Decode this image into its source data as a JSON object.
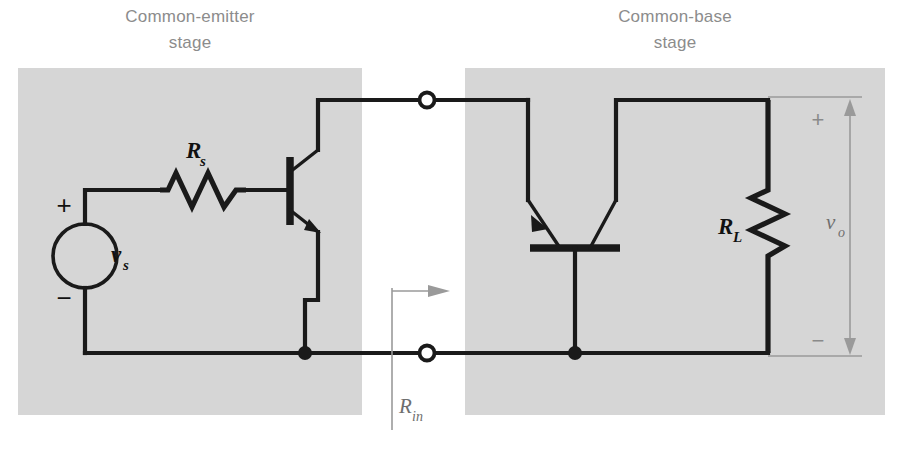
{
  "figure": {
    "type": "circuit-schematic",
    "width": 902,
    "height": 449,
    "background_color": "#ffffff",
    "panel_color": "#d6d6d6",
    "wire_color": "#1a1a1a",
    "annotation_color": "#9a9a9a"
  },
  "stages": [
    {
      "id": "common-emitter",
      "label_line1": "Common-emitter",
      "label_line2": "stage"
    },
    {
      "id": "common-base",
      "label_line1": "Common-base",
      "label_line2": "stage"
    }
  ],
  "components": {
    "source": {
      "name": "voltage-source",
      "label": "v",
      "subscript": "s",
      "plus_sign": "+",
      "minus_sign": "−"
    },
    "source_resistor": {
      "name": "series-source-resistor",
      "label": "R",
      "subscript": "s",
      "orientation": "horizontal"
    },
    "load_resistor": {
      "name": "load-resistor",
      "label": "R",
      "subscript": "L",
      "orientation": "vertical"
    },
    "transistor_q1": {
      "name": "npn-transistor-common-emitter",
      "type": "NPN",
      "orientation": "vertical"
    },
    "transistor_q2": {
      "name": "npn-transistor-common-base",
      "type": "NPN",
      "orientation": "rotated-base-down"
    }
  },
  "terminals": [
    {
      "name": "interstage-terminal-top",
      "style": "open-circle"
    },
    {
      "name": "interstage-terminal-bottom",
      "style": "open-circle"
    }
  ],
  "nodes": [
    {
      "name": "common-emitter-ground-node",
      "style": "filled-dot"
    },
    {
      "name": "common-base-ground-node",
      "style": "filled-dot"
    }
  ],
  "annotations": {
    "input_resistance": {
      "name": "r-in-annotation",
      "label": "R",
      "subscript": "in",
      "arrow": "right",
      "style": "dashed-gray"
    },
    "output_voltage": {
      "name": "v-out-annotation",
      "label": "v",
      "subscript": "o",
      "plus_sign": "+",
      "minus_sign": "−",
      "arrow": "double-ended-vertical",
      "style": "dashed-gray"
    }
  }
}
